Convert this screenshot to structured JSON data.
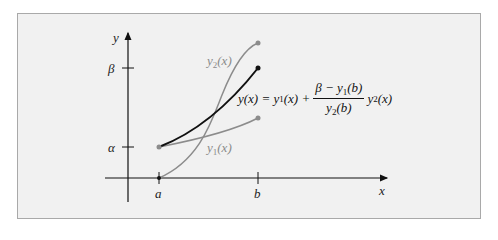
{
  "diagram": {
    "axes": {
      "x_label": "x",
      "y_label": "y",
      "x_ticks": [
        "a",
        "b"
      ],
      "y_ticks": [
        "α",
        "β"
      ]
    },
    "curves": [
      {
        "name": "y1",
        "label_base": "y",
        "label_sub": "1",
        "label_arg": "(x)",
        "color": "#8c8c8c",
        "from": "α at a",
        "to": "y1(b)"
      },
      {
        "name": "y2",
        "label_base": "y",
        "label_sub": "2",
        "label_arg": "(x)",
        "color": "#8c8c8c",
        "from": "0 at a",
        "to": "y2(b)"
      },
      {
        "name": "y",
        "label_base": "y",
        "label_arg": "(x)",
        "color": "#111111",
        "from": "α at a",
        "to": "β at b"
      }
    ],
    "formula": {
      "lhs": "y(x) =",
      "term1_base": "y",
      "term1_sub": "1",
      "term1_arg": "(x) +",
      "numerator_prefix": "β − y",
      "numerator_sub": "1",
      "numerator_suffix": "(b)",
      "denominator_base": "y",
      "denominator_sub": "2",
      "denominator_suffix": "(b)",
      "term2_base": "y",
      "term2_sub": "2",
      "term2_arg": "(x)"
    },
    "colors": {
      "background": "#f1f1f1",
      "frame_border": "#a9a9a9",
      "axis": "#111111",
      "solution_curve": "#111111",
      "helper_curves": "#8c8c8c"
    }
  }
}
